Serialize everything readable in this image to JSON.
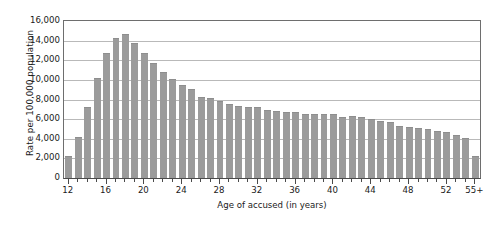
{
  "chart_data": {
    "type": "bar",
    "title": "",
    "xlabel": "Age of accused (in years)",
    "ylabel": "Rate per 100,000 population",
    "ylim": [
      0,
      16000
    ],
    "ytick_labels": [
      "0",
      "2,000",
      "4,000",
      "6,000",
      "8,000",
      "10,000",
      "12,000",
      "14,000",
      "16,000"
    ],
    "ytick_values": [
      0,
      2000,
      4000,
      6000,
      8000,
      10000,
      12000,
      14000,
      16000
    ],
    "xtick_labels": [
      "12",
      "16",
      "20",
      "24",
      "28",
      "32",
      "36",
      "40",
      "44",
      "48",
      "52",
      "55+"
    ],
    "xtick_values": [
      12,
      16,
      20,
      24,
      28,
      32,
      36,
      40,
      44,
      48,
      52,
      55
    ],
    "grid": true,
    "legend": "none",
    "bar_color": "#9b9b9b",
    "categories": [
      "12",
      "13",
      "14",
      "15",
      "16",
      "17",
      "18",
      "19",
      "20",
      "21",
      "22",
      "23",
      "24",
      "25",
      "26",
      "27",
      "28",
      "29",
      "30",
      "31",
      "32",
      "33",
      "34",
      "35",
      "36",
      "37",
      "38",
      "39",
      "40",
      "41",
      "42",
      "43",
      "44",
      "45",
      "46",
      "47",
      "48",
      "49",
      "50",
      "51",
      "52",
      "53",
      "54",
      "55+"
    ],
    "values": [
      2200,
      4200,
      7200,
      10200,
      12700,
      14300,
      14700,
      13800,
      12700,
      11700,
      10800,
      10100,
      9500,
      9050,
      8250,
      8150,
      7800,
      7500,
      7350,
      7250,
      7200,
      6950,
      6800,
      6750,
      6750,
      6500,
      6500,
      6550,
      6550,
      6250,
      6300,
      6200,
      6000,
      5800,
      5750,
      5350,
      5200,
      5100,
      5000,
      4750,
      4650,
      4400,
      4100,
      2200
    ]
  }
}
